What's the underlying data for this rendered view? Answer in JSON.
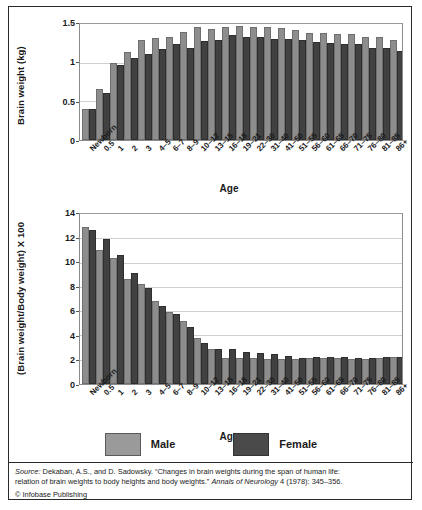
{
  "figure": {
    "legend": {
      "items": [
        {
          "label": "Male",
          "color": "#9a9a9a"
        },
        {
          "label": "Female",
          "color": "#4a4a4a"
        }
      ]
    },
    "source": {
      "prefix": "Source:",
      "line1_rest": " Dekaban, A.S., and D. Sadowsky. “Changes in brain weights during the span of human life:",
      "line2_a": "relation of brain weights to body heights and body weights.” ",
      "line2_journal": "Annals of Neurology",
      "line2_b": " 4 (1978): 345–356.",
      "copyright": "© Infobase Publishing"
    }
  },
  "chart_data": [
    {
      "type": "bar",
      "title": "",
      "xlabel": "Age",
      "ylabel": "Brain weight (kg)",
      "ylim": [
        0,
        1.5
      ],
      "yticks": [
        0,
        0.5,
        1,
        1.5
      ],
      "ytick_labels": [
        "0",
        "0.5",
        "1",
        "1.5"
      ],
      "grid": true,
      "legend_position": "bottom",
      "categories": [
        "Newborn",
        "0.5",
        "1",
        "2",
        "3",
        "4–5",
        "6–7",
        "8–9",
        "10–12",
        "13–15",
        "16–18",
        "19–21",
        "22–30",
        "31–40",
        "41–50",
        "51–55",
        "56–60",
        "61–65",
        "66–70",
        "71–75",
        "76–80",
        "81–85",
        "86+"
      ],
      "series": [
        {
          "name": "Male",
          "color": "#8d8d8d",
          "values": [
            0.38,
            0.64,
            0.97,
            1.11,
            1.27,
            1.29,
            1.31,
            1.37,
            1.44,
            1.41,
            1.44,
            1.45,
            1.43,
            1.43,
            1.42,
            1.4,
            1.36,
            1.36,
            1.35,
            1.34,
            1.31,
            1.3,
            1.27
          ]
        },
        {
          "name": "Female",
          "color": "#414141",
          "values": [
            0.37,
            0.58,
            0.94,
            1.03,
            1.08,
            1.15,
            1.21,
            1.17,
            1.26,
            1.27,
            1.33,
            1.31,
            1.3,
            1.28,
            1.28,
            1.27,
            1.24,
            1.23,
            1.22,
            1.21,
            1.17,
            1.16,
            1.12
          ]
        }
      ]
    },
    {
      "type": "bar",
      "title": "",
      "xlabel": "Age",
      "ylabel": "(Brain weight/Body weight) X 100",
      "ylim": [
        0,
        14
      ],
      "yticks": [
        0,
        2,
        4,
        6,
        8,
        10,
        12,
        14
      ],
      "ytick_labels": [
        "0",
        "2",
        "4",
        "6",
        "8",
        "10",
        "12",
        "14"
      ],
      "grid": true,
      "legend_position": "bottom",
      "categories": [
        "Newborn",
        "0.5",
        "1",
        "2",
        "3",
        "4–5",
        "6–7",
        "8–9",
        "10–12",
        "13–15",
        "16–18",
        "19–21",
        "22–30",
        "31–40",
        "41–50",
        "51–55",
        "56–60",
        "61–65",
        "66–70",
        "71–75",
        "76–80",
        "81–85",
        "86+"
      ],
      "series": [
        {
          "name": "Male",
          "color": "#8d8d8d",
          "values": [
            12.8,
            10.85,
            10.2,
            8.5,
            8.1,
            6.65,
            5.75,
            5.0,
            3.65,
            2.75,
            1.95,
            2.0,
            1.95,
            1.9,
            1.9,
            1.9,
            1.95,
            1.95,
            1.95,
            1.9,
            1.9,
            1.95,
            2.1
          ]
        },
        {
          "name": "Female",
          "color": "#414141",
          "values": [
            12.5,
            11.75,
            10.5,
            8.95,
            7.75,
            6.25,
            5.6,
            4.5,
            3.2,
            2.75,
            2.7,
            2.45,
            2.4,
            2.3,
            2.15,
            2.0,
            2.05,
            2.05,
            2.05,
            2.0,
            2.0,
            2.1,
            2.05
          ]
        }
      ]
    }
  ]
}
